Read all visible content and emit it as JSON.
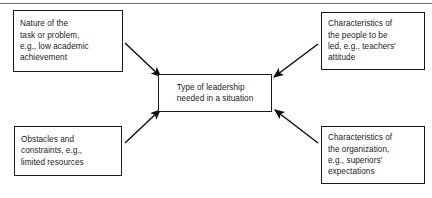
{
  "diagram": {
    "type": "convergent-influence-diagram",
    "title_rule": "horizontal-divider",
    "center": {
      "id": "type-of-leadership",
      "text": "Type of leadership\nneeded in a situation"
    },
    "sources": [
      {
        "id": "nature-of-task",
        "position": "top-left",
        "text": "Nature of the\ntask or problem,\ne.g., low academic\nachievement"
      },
      {
        "id": "characteristics-of-people",
        "position": "top-right",
        "text": "Characteristics of\nthe people to be\nled, e.g., teachers'\nattitude"
      },
      {
        "id": "obstacles-and-constraints",
        "position": "bottom-left",
        "text": "Obstacles and\nconstraints, e.g.,\nlimited resources"
      },
      {
        "id": "characteristics-of-organization",
        "position": "bottom-right",
        "text": "Characteristics of\nthe organization,\ne.g., superiors'\nexpectations"
      }
    ],
    "arrows": [
      {
        "id": "arrow-task-to-center",
        "from": "nature-of-task",
        "to": "type-of-leadership",
        "direction": "down-right"
      },
      {
        "id": "arrow-people-to-center",
        "from": "characteristics-of-people",
        "to": "type-of-leadership",
        "direction": "down-left"
      },
      {
        "id": "arrow-obstacles-to-center",
        "from": "obstacles-and-constraints",
        "to": "type-of-leadership",
        "direction": "up-right"
      },
      {
        "id": "arrow-organization-to-center",
        "from": "characteristics-of-organization",
        "to": "type-of-leadership",
        "direction": "up-left"
      }
    ],
    "colors": {
      "box_border": "#1a1a1a",
      "text": "#1b1b1b",
      "arrow": "#111111",
      "rule": "#6e6e6e",
      "background": "#ffffff"
    }
  }
}
